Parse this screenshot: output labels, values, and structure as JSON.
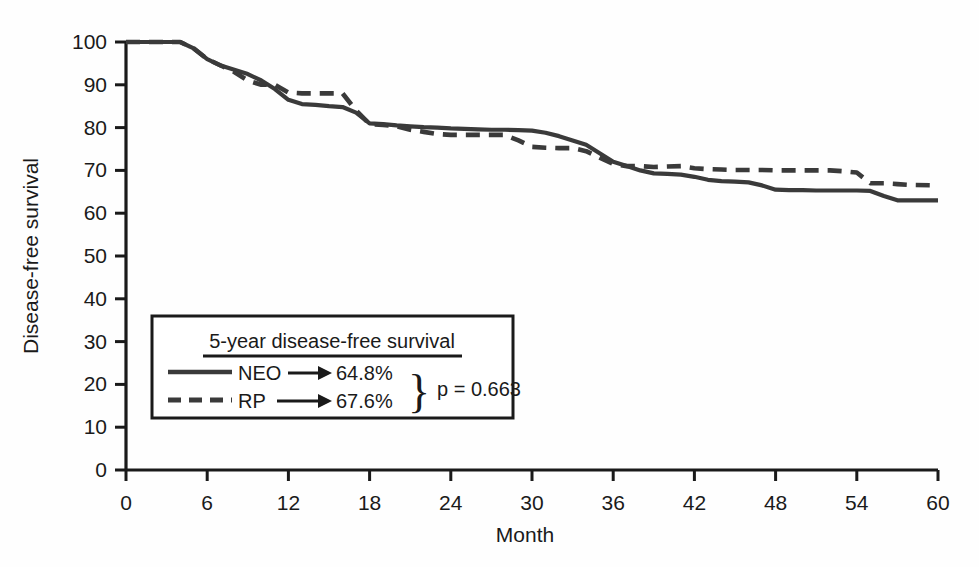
{
  "chart_data": {
    "type": "line",
    "title": "",
    "xlabel": "Month",
    "ylabel": "Disease-free survival",
    "xlim": [
      0,
      60
    ],
    "ylim": [
      0,
      100
    ],
    "xticks": [
      0,
      6,
      12,
      18,
      24,
      30,
      36,
      42,
      48,
      54,
      60
    ],
    "yticks": [
      0,
      10,
      20,
      30,
      40,
      50,
      60,
      70,
      80,
      90,
      100
    ],
    "grid": false,
    "legend_position": "inside-lower-left",
    "series": [
      {
        "name": "NEO",
        "style": "solid",
        "color": "#3a3a3a",
        "five_year_value": "64.8%",
        "x": [
          0,
          4,
          5,
          6,
          7,
          8,
          9,
          10,
          11,
          12,
          13,
          14,
          15,
          16,
          17,
          18,
          19,
          20,
          21,
          22,
          23,
          24,
          25,
          26,
          27,
          28,
          29,
          30,
          31,
          32,
          33,
          34,
          35,
          36,
          37,
          38,
          39,
          40,
          41,
          42,
          43,
          44,
          45,
          46,
          47,
          48,
          49,
          50,
          51,
          52,
          53,
          54,
          55,
          56,
          57,
          58,
          60
        ],
        "y": [
          100,
          100,
          98.5,
          96,
          94.5,
          93.5,
          92.5,
          91,
          89,
          86.5,
          85.5,
          85.3,
          85,
          84.8,
          83.5,
          81,
          80.8,
          80.5,
          80.3,
          80.1,
          80,
          79.8,
          79.7,
          79.6,
          79.5,
          79.5,
          79.4,
          79.3,
          78.8,
          78,
          77,
          76,
          74,
          72,
          71,
          70,
          69.3,
          69.2,
          69,
          68.5,
          67.8,
          67.5,
          67.4,
          67.2,
          66.5,
          65.5,
          65.4,
          65.4,
          65.3,
          65.3,
          65.3,
          65.3,
          65.2,
          64,
          63,
          63,
          63
        ]
      },
      {
        "name": "RP",
        "style": "dashed",
        "color": "#3a3a3a",
        "five_year_value": "67.6%",
        "x": [
          0,
          4,
          5,
          6,
          7,
          8,
          9,
          10,
          11,
          12,
          13,
          14,
          15,
          16,
          17,
          18,
          19,
          20,
          21,
          22,
          23,
          24,
          25,
          26,
          27,
          28,
          29,
          30,
          31,
          32,
          33,
          34,
          35,
          36,
          37,
          38,
          39,
          40,
          41,
          42,
          43,
          44,
          45,
          46,
          47,
          48,
          49,
          50,
          51,
          52,
          53,
          54,
          55,
          56,
          57,
          58,
          60
        ],
        "y": [
          100,
          100,
          98.5,
          96,
          94.5,
          93,
          91,
          90,
          90,
          88.2,
          88,
          88,
          88,
          88,
          84,
          80.8,
          80.6,
          80.3,
          79.5,
          79,
          78.5,
          78.3,
          78.3,
          78.3,
          78.3,
          78.3,
          77,
          75.5,
          75.3,
          75.2,
          75.2,
          74.5,
          73,
          71.5,
          71,
          71,
          70.8,
          70.9,
          71,
          70.5,
          70.3,
          70.2,
          70.1,
          70.1,
          70.1,
          70,
          70,
          70,
          70,
          70,
          69.8,
          69.5,
          67,
          67,
          66.8,
          66.6,
          66.5
        ]
      }
    ],
    "legend": {
      "title": "5-year disease-free survival",
      "entries": [
        {
          "label": "NEO",
          "value": "64.8%",
          "style": "solid"
        },
        {
          "label": "RP",
          "value": "67.6%",
          "style": "dashed"
        }
      ],
      "pvalue": "p = 0.663",
      "brace": "}"
    }
  }
}
